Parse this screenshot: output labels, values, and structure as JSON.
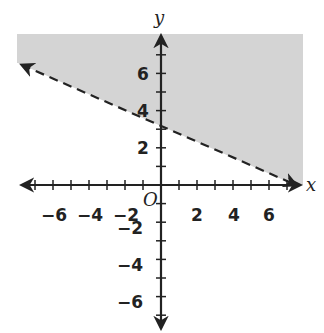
{
  "chart_data": {
    "type": "line",
    "title": "",
    "xlabel": "x",
    "ylabel": "y",
    "origin_label": "O",
    "xlim": [
      -8,
      8
    ],
    "ylim": [
      -8,
      8
    ],
    "x_ticks": [
      -7,
      -6,
      -5,
      -4,
      -3,
      -2,
      -1,
      1,
      2,
      3,
      4,
      5,
      6,
      7
    ],
    "y_ticks": [
      -7,
      -6,
      -5,
      -4,
      -3,
      -2,
      -1,
      1,
      2,
      3,
      4,
      5,
      6,
      7
    ],
    "x_tick_labels": [
      "-6",
      "-4",
      "-2",
      "2",
      "4",
      "6"
    ],
    "y_tick_labels": [
      "6",
      "4",
      "2",
      "-2",
      "-4",
      "-6"
    ],
    "grid": false,
    "series": [
      {
        "name": "boundary line",
        "style": "dashed",
        "x": [
          -7.9,
          0,
          7.4
        ],
        "y": [
          6.6,
          3,
          0
        ],
        "y_intercept": 3
      }
    ],
    "shaded_region": {
      "description": "half-plane above the dashed line",
      "color": "#d4d4d4"
    }
  },
  "labels": {
    "x_axis": "x",
    "y_axis": "y",
    "origin": "O",
    "x_ticks": [
      {
        "text": "−6",
        "value": -6
      },
      {
        "text": "−4",
        "value": -4
      },
      {
        "text": "−2",
        "value": -2
      },
      {
        "text": "2",
        "value": 2
      },
      {
        "text": "4",
        "value": 4
      },
      {
        "text": "6",
        "value": 6
      }
    ],
    "y_ticks": [
      {
        "text": "6",
        "value": 6
      },
      {
        "text": "4",
        "value": 4
      },
      {
        "text": "2",
        "value": 2
      },
      {
        "text": "−2",
        "value": -2
      },
      {
        "text": "−4",
        "value": -4
      },
      {
        "text": "−6",
        "value": -6
      }
    ]
  },
  "colors": {
    "shade": "#d4d4d4",
    "ink": "#222222"
  }
}
